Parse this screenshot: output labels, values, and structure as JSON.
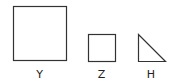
{
  "diagram": {
    "shapes": [
      {
        "id": "Y",
        "type": "square",
        "label": "Y",
        "x": 13,
        "y": 6,
        "size": 53
      },
      {
        "id": "Z",
        "type": "square",
        "label": "Z",
        "x": 88,
        "y": 34,
        "size": 27
      },
      {
        "id": "H",
        "type": "right-triangle",
        "label": "H",
        "points": [
          [
            138,
            34
          ],
          [
            138,
            61
          ],
          [
            165,
            61
          ]
        ]
      }
    ],
    "labels": {
      "y": "Y",
      "z": "Z",
      "h": "H"
    },
    "stroke_color": "#333333",
    "background": "#ffffff"
  }
}
